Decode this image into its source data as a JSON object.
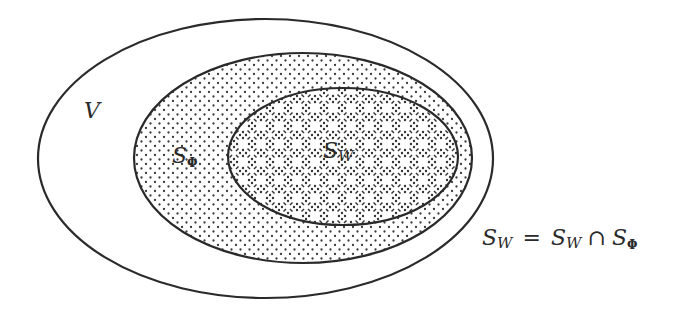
{
  "diagram": {
    "colors": {
      "stroke": "#2a2a2a",
      "background": "#ffffff",
      "dot": "#3a3a3a"
    },
    "sets": [
      {
        "id": "V",
        "label": "V",
        "fill": "none"
      },
      {
        "id": "S_Phi",
        "label_main": "S",
        "label_sub": "Φ",
        "fill": "dotted"
      },
      {
        "id": "S_W",
        "label_main": "S",
        "label_sub": "W",
        "fill": "crosshatch-dotted"
      }
    ],
    "equation": {
      "lhs_main": "S",
      "lhs_sub": "W",
      "equals": "=",
      "rhs1_main": "S",
      "rhs1_sub": "W",
      "intersect": "∩",
      "rhs2_main": "S",
      "rhs2_sub": "Φ"
    }
  }
}
